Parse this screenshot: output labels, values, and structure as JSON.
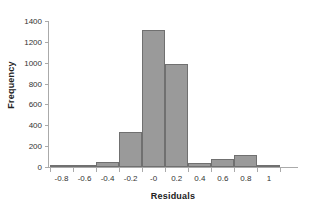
{
  "chart_data": {
    "type": "bar",
    "title": "",
    "subtitle": "",
    "xlabel": "Residuals",
    "ylabel": "Frequency",
    "categories": [
      "-0.8",
      "-0.6",
      "-0.4",
      "-0.2",
      "-0",
      "0.2",
      "0.4",
      "0.6",
      "0.8",
      "1"
    ],
    "values": [
      0,
      5,
      50,
      340,
      1310,
      990,
      35,
      80,
      115,
      20
    ],
    "series": [
      {
        "name": "Frequency",
        "values": [
          0,
          5,
          50,
          340,
          1310,
          990,
          35,
          80,
          115,
          20
        ]
      }
    ],
    "ylim": [
      0,
      1400
    ],
    "y_ticks": [
      0,
      200,
      400,
      600,
      800,
      1000,
      1200,
      1400
    ],
    "y_tick_labels": [
      "0",
      "200",
      "400",
      "600",
      "800",
      "1000",
      "1200",
      "1400"
    ],
    "x_tick_labels": [
      "-0.8",
      "-0.6",
      "-0.4",
      "-0.2",
      "-0",
      "0.2",
      "0.4",
      "0.6",
      "0.8",
      "1"
    ],
    "grid": false,
    "legend": false,
    "legend_position": "none",
    "bar_fill_color": "#9a9a9a",
    "bar_border_color": "#707070",
    "axis_color": "#aaaaaa",
    "background_color": "#ffffff",
    "bar_gap": 0
  }
}
